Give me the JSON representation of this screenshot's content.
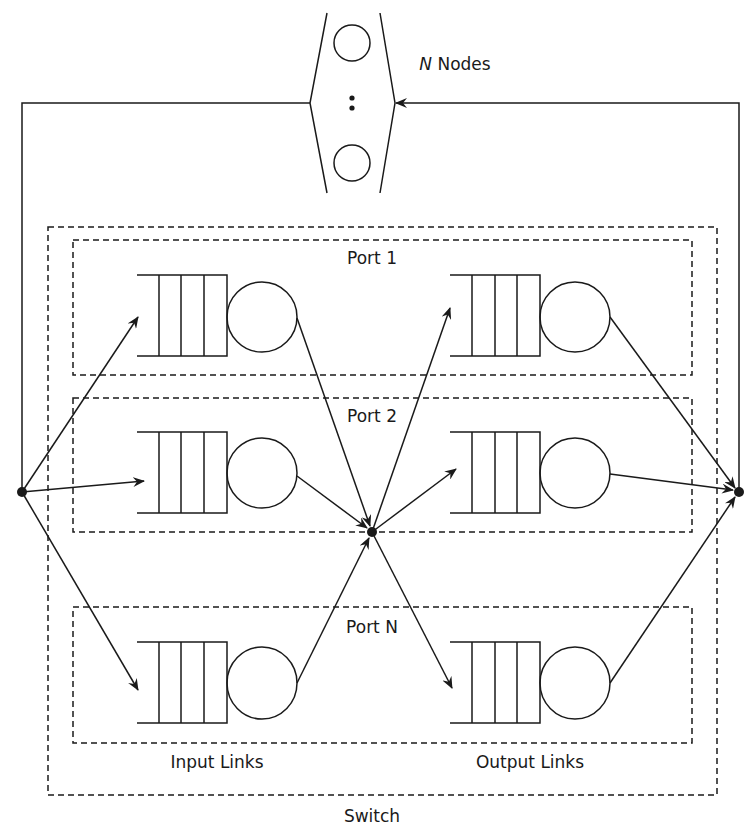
{
  "diagram": {
    "nodes_label_var": "N",
    "nodes_label_text": " Nodes",
    "switch_label": "Switch",
    "input_links_label": "Input Links",
    "output_links_label": "Output Links",
    "ports": [
      {
        "label": "Port 1"
      },
      {
        "label": "Port 2"
      },
      {
        "label": "Port N"
      }
    ],
    "nodes_ellipsis": ":",
    "colors": {
      "stroke": "#1a1a1a",
      "background": "#ffffff"
    }
  }
}
